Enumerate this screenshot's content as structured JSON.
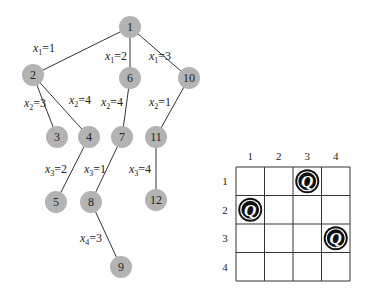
{
  "tree": {
    "nodes": [
      {
        "id": "1",
        "label": "1",
        "x": 130,
        "y": 27
      },
      {
        "id": "2",
        "label": "2",
        "x": 33,
        "y": 75
      },
      {
        "id": "6",
        "label": "6",
        "x": 130,
        "y": 78
      },
      {
        "id": "10",
        "label": "10",
        "x": 189,
        "y": 78
      },
      {
        "id": "3",
        "label": "3",
        "x": 57,
        "y": 137
      },
      {
        "id": "4",
        "label": "4",
        "x": 89,
        "y": 137
      },
      {
        "id": "7",
        "label": "7",
        "x": 122,
        "y": 137
      },
      {
        "id": "11",
        "label": "11",
        "x": 156,
        "y": 137
      },
      {
        "id": "5",
        "label": "5",
        "x": 56,
        "y": 202
      },
      {
        "id": "8",
        "label": "8",
        "x": 91,
        "y": 202
      },
      {
        "id": "12",
        "label": "12",
        "x": 156,
        "y": 200
      },
      {
        "id": "9",
        "label": "9",
        "x": 121,
        "y": 267
      }
    ],
    "edges": [
      {
        "from": "1",
        "to": "2",
        "var": "x",
        "sub": "1",
        "val": "=1",
        "lx": 33,
        "ly": 52
      },
      {
        "from": "1",
        "to": "6",
        "var": "x",
        "sub": "1",
        "val": "=2",
        "lx": 105,
        "ly": 60
      },
      {
        "from": "1",
        "to": "10",
        "var": "x",
        "sub": "1",
        "val": "=3",
        "lx": 149,
        "ly": 60
      },
      {
        "from": "2",
        "to": "3",
        "var": "x",
        "sub": "2",
        "val": "=3",
        "lx": 24,
        "ly": 107
      },
      {
        "from": "2",
        "to": "4",
        "var": "x",
        "sub": "2",
        "val": "=4",
        "lx": 69,
        "ly": 104
      },
      {
        "from": "6",
        "to": "7",
        "var": "x",
        "sub": "2",
        "val": "=4",
        "lx": 101,
        "ly": 106
      },
      {
        "from": "10",
        "to": "11",
        "var": "x",
        "sub": "2",
        "val": "=1",
        "lx": 149,
        "ly": 106
      },
      {
        "from": "4",
        "to": "5",
        "var": "x",
        "sub": "3",
        "val": "=2",
        "lx": 45,
        "ly": 173
      },
      {
        "from": "7",
        "to": "8",
        "var": "x",
        "sub": "3",
        "val": "=1",
        "lx": 84,
        "ly": 173
      },
      {
        "from": "11",
        "to": "12",
        "var": "x",
        "sub": "3",
        "val": "=4",
        "lx": 129,
        "ly": 173
      },
      {
        "from": "8",
        "to": "9",
        "var": "x",
        "sub": "4",
        "val": "=3",
        "lx": 80,
        "ly": 242
      }
    ],
    "node_radius": 11,
    "node_color": "#b3b3b3"
  },
  "board": {
    "left": 236,
    "top": 167,
    "cell_w": 28.5,
    "cell_h": 28.5,
    "size": 4,
    "col_labels": [
      "1",
      "2",
      "3",
      "4"
    ],
    "row_labels": [
      "1",
      "2",
      "3",
      "4"
    ],
    "queen_symbol": "Q",
    "queens": [
      {
        "row": 1,
        "col": 3
      },
      {
        "row": 2,
        "col": 1
      },
      {
        "row": 3,
        "col": 4
      }
    ]
  }
}
